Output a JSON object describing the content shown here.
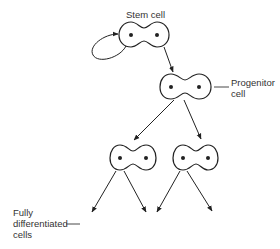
{
  "diagram": {
    "labels": {
      "stem_cell": "Stem cell",
      "progenitor_line1": "Progenitor",
      "progenitor_line2": "cell",
      "differentiated_line1": "Fully",
      "differentiated_line2": "differentiated",
      "differentiated_line3": "cells"
    },
    "nodes": [
      {
        "id": "stem",
        "label": "Stem cell",
        "type": "dividing-cell"
      },
      {
        "id": "progenitor",
        "label": "Progenitor cell",
        "type": "dividing-cell"
      },
      {
        "id": "daughter-left",
        "type": "dividing-cell"
      },
      {
        "id": "daughter-right",
        "type": "dividing-cell"
      }
    ],
    "edges": [
      {
        "from": "stem",
        "to": "stem",
        "kind": "self-renewal-loop"
      },
      {
        "from": "stem",
        "to": "progenitor"
      },
      {
        "from": "progenitor",
        "to": "daughter-left"
      },
      {
        "from": "progenitor",
        "to": "daughter-right"
      },
      {
        "from": "daughter-left",
        "to": "fully-differentiated-1"
      },
      {
        "from": "daughter-left",
        "to": "fully-differentiated-2"
      },
      {
        "from": "daughter-right",
        "to": "fully-differentiated-3"
      },
      {
        "from": "daughter-right",
        "to": "fully-differentiated-4"
      }
    ],
    "colors": {
      "stroke": "#222222",
      "text": "#333333",
      "background": "#ffffff"
    }
  }
}
